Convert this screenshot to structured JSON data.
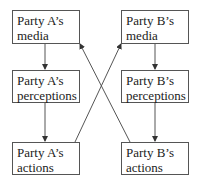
{
  "diagram": {
    "type": "flow-diagram",
    "boxes": [
      {
        "id": "a_media",
        "line1": "Party A’s",
        "line2": "media"
      },
      {
        "id": "a_perceptions",
        "line1": "Party A’s",
        "line2": "perceptions"
      },
      {
        "id": "a_actions",
        "line1": "Party A’s",
        "line2": "actions"
      },
      {
        "id": "b_media",
        "line1": "Party B’s",
        "line2": "media"
      },
      {
        "id": "b_perceptions",
        "line1": "Party B’s",
        "line2": "perceptions"
      },
      {
        "id": "b_actions",
        "line1": "Party B’s",
        "line2": "actions"
      }
    ],
    "edges": [
      {
        "from": "a_media",
        "to": "a_perceptions"
      },
      {
        "from": "a_perceptions",
        "to": "a_actions"
      },
      {
        "from": "b_media",
        "to": "b_perceptions"
      },
      {
        "from": "b_perceptions",
        "to": "b_actions"
      },
      {
        "from": "a_actions",
        "to": "b_media"
      },
      {
        "from": "b_actions",
        "to": "a_media"
      }
    ],
    "colors": {
      "stroke": "#555555",
      "text": "#222222",
      "background": "#ffffff"
    }
  }
}
